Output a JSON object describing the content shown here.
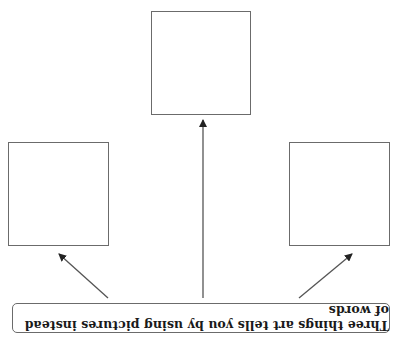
{
  "diagram": {
    "orientation": "rotated-180",
    "prompt_label": "Three things art tells you by using pictures instead of words",
    "answer_boxes": [
      {
        "id": "box-1",
        "text": ""
      },
      {
        "id": "box-2",
        "text": ""
      },
      {
        "id": "box-3",
        "text": ""
      }
    ],
    "colors": {
      "line": "#6b6b6b",
      "arrow": "#222222",
      "text": "#1a1a1a",
      "background": "#ffffff"
    }
  }
}
